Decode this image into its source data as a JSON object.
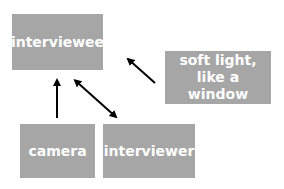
{
  "diagram": {
    "nodes": {
      "interviewee": {
        "label": "interviewee"
      },
      "light": {
        "line1": "soft light,",
        "line2": "like a window"
      },
      "camera": {
        "label": "camera"
      },
      "interviewer": {
        "label": "interviewer"
      }
    },
    "edges": [
      {
        "from": "camera",
        "to": "interviewee",
        "type": "single-arrow"
      },
      {
        "from": "interviewer",
        "to": "interviewee",
        "type": "double-arrow"
      },
      {
        "from": "light",
        "to": "interviewee",
        "type": "single-arrow"
      }
    ],
    "colors": {
      "box": "#a6a6a6",
      "text": "#ffffff",
      "arrow": "#000000"
    }
  }
}
